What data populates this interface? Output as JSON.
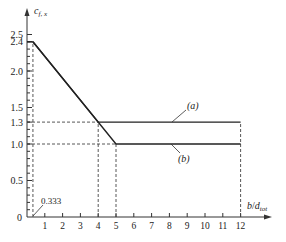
{
  "chart_data": {
    "type": "line",
    "title": "",
    "xlabel": "b/d_tot",
    "ylabel": "c_f,x",
    "xlim": [
      0,
      12.5
    ],
    "ylim": [
      0,
      2.6
    ],
    "x_ticks": [
      1,
      2,
      3,
      4,
      5,
      6,
      7,
      8,
      9,
      10,
      11,
      12
    ],
    "y_ticks": [
      0,
      0.5,
      1.0,
      1.3,
      1.5,
      2.0,
      2.4,
      2.5
    ],
    "y_tick_labels": [
      "0",
      "0.5",
      "1.0",
      "1.3",
      "1.5",
      "2.0",
      "2.4",
      "2.5"
    ],
    "grid": false,
    "series": [
      {
        "name": "(a)",
        "x": [
          0.333,
          4,
          12
        ],
        "y": [
          2.4,
          1.3,
          1.3
        ]
      },
      {
        "name": "(b)",
        "x": [
          0.333,
          5,
          12
        ],
        "y": [
          2.4,
          1.0,
          1.0
        ]
      }
    ],
    "annotations": [
      {
        "text": "0.333",
        "x": 0.333,
        "y": 0
      },
      {
        "text": "(a)",
        "target_series": "(a)"
      },
      {
        "text": "(b)",
        "target_series": "(b)"
      }
    ],
    "reference_lines": [
      {
        "type": "vertical",
        "x": 0.333,
        "from_y": 0,
        "to_y": 2.4,
        "style": "dashed"
      },
      {
        "type": "vertical",
        "x": 4,
        "from_y": 0,
        "to_y": 1.3,
        "style": "dashed"
      },
      {
        "type": "vertical",
        "x": 5,
        "from_y": 0,
        "to_y": 1.0,
        "style": "dashed"
      },
      {
        "type": "vertical",
        "x": 12,
        "from_y": 0,
        "to_y": 1.3,
        "style": "dashed"
      },
      {
        "type": "horizontal",
        "y": 1.3,
        "from_x": 0,
        "to_x": 4,
        "style": "dashed"
      },
      {
        "type": "horizontal",
        "y": 1.0,
        "from_x": 0,
        "to_x": 5,
        "style": "dashed"
      }
    ]
  },
  "labels": {
    "ylabel_main": "c",
    "ylabel_sub": "f, x",
    "xlabel_b": "b",
    "xlabel_slash": "/",
    "xlabel_d": "d",
    "xlabel_sub": "tot",
    "annot_0333": "0.333",
    "series_a": "(a)",
    "series_b": "(b)",
    "origin": "0"
  }
}
